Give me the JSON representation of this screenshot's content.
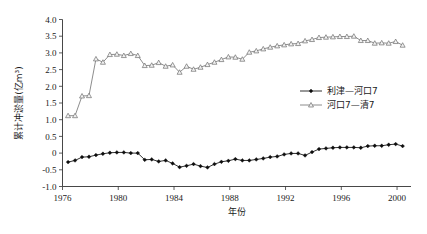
{
  "chart_data": {
    "type": "line",
    "title": "",
    "xlabel": "年份",
    "ylabel": "累计冲淤量(亿m³)",
    "xlim": [
      1976,
      2001
    ],
    "ylim": [
      -1.0,
      4.0
    ],
    "grid": false,
    "legend_position": "center-right",
    "xticks": [
      "1976",
      "1980",
      "1984",
      "1988",
      "1992",
      "1996",
      "2000"
    ],
    "xtick_values": [
      1976,
      1980,
      1984,
      1988,
      1992,
      1996,
      2000
    ],
    "yticks": [
      "-1.0",
      "-0.5",
      "0",
      "0.5",
      "1.0",
      "1.5",
      "2.0",
      "2.5",
      "3.0",
      "3.5",
      "4.0"
    ],
    "ytick_values": [
      -1.0,
      -0.5,
      0,
      0.5,
      1.0,
      1.5,
      2.0,
      2.5,
      3.0,
      3.5,
      4.0
    ],
    "x": [
      1976.4,
      1976.9,
      1977.4,
      1977.9,
      1978.4,
      1978.9,
      1979.4,
      1979.9,
      1980.4,
      1980.9,
      1981.4,
      1981.9,
      1982.4,
      1982.9,
      1983.4,
      1983.9,
      1984.4,
      1984.9,
      1985.4,
      1985.9,
      1986.4,
      1986.9,
      1987.4,
      1987.9,
      1988.4,
      1988.9,
      1989.4,
      1989.9,
      1990.4,
      1990.9,
      1991.4,
      1991.9,
      1992.4,
      1992.9,
      1993.4,
      1993.9,
      1994.4,
      1994.9,
      1995.4,
      1995.9,
      1996.4,
      1996.9,
      1997.4,
      1997.9,
      1998.4,
      1998.9,
      1999.4,
      1999.9,
      2000.4
    ],
    "series": [
      {
        "name": "利津—河口7",
        "color": "#1c1c1c",
        "marker": "filled-diamond",
        "values": [
          -0.27,
          -0.22,
          -0.12,
          -0.11,
          -0.06,
          -0.02,
          0.01,
          0.02,
          0.02,
          0.0,
          0.0,
          -0.2,
          -0.19,
          -0.25,
          -0.22,
          -0.31,
          -0.42,
          -0.38,
          -0.33,
          -0.39,
          -0.43,
          -0.33,
          -0.26,
          -0.23,
          -0.18,
          -0.22,
          -0.22,
          -0.19,
          -0.16,
          -0.12,
          -0.1,
          -0.04,
          -0.01,
          -0.01,
          -0.07,
          0.03,
          0.12,
          0.14,
          0.16,
          0.17,
          0.17,
          0.17,
          0.16,
          0.21,
          0.22,
          0.22,
          0.25,
          0.27,
          0.21
        ]
      },
      {
        "name": "河口7—清7",
        "color": "#808080",
        "marker": "open-triangle",
        "values": [
          1.12,
          1.12,
          1.71,
          1.72,
          2.82,
          2.72,
          2.95,
          2.96,
          2.92,
          2.98,
          2.92,
          2.62,
          2.63,
          2.71,
          2.6,
          2.64,
          2.42,
          2.6,
          2.51,
          2.57,
          2.65,
          2.72,
          2.8,
          2.88,
          2.87,
          2.81,
          3.02,
          3.06,
          3.12,
          3.17,
          3.21,
          3.24,
          3.27,
          3.28,
          3.36,
          3.4,
          3.46,
          3.47,
          3.48,
          3.49,
          3.49,
          3.5,
          3.37,
          3.37,
          3.29,
          3.3,
          3.29,
          3.34,
          3.23
        ]
      }
    ]
  }
}
